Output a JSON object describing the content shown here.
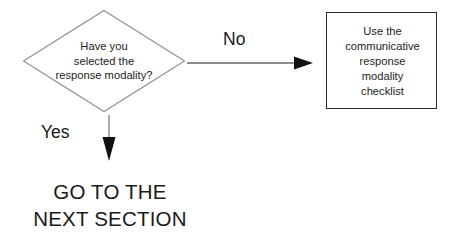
{
  "diagram": {
    "type": "flowchart",
    "background_color": "#ffffff",
    "decision": {
      "shape": "diamond",
      "border_color": "#8c8c8c",
      "lines": [
        "Have you",
        "selected the",
        "response modality?"
      ]
    },
    "process": {
      "shape": "rectangle",
      "border_color": "#2b2b2b",
      "lines": [
        "Use the",
        "communicative",
        "response",
        "modality",
        "checklist"
      ]
    },
    "edges": [
      {
        "label": "No",
        "direction": "right",
        "from": "decision",
        "to": "process"
      },
      {
        "label": "Yes",
        "direction": "down",
        "from": "decision",
        "to": "terminal"
      }
    ],
    "terminal": {
      "lines": [
        "GO TO THE",
        "NEXT SECTION"
      ]
    }
  }
}
